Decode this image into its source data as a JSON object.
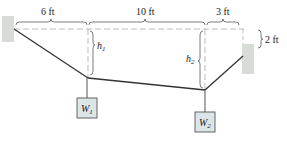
{
  "diagram": {
    "dimensions": {
      "span_left": "6 ft",
      "span_middle": "10 ft",
      "span_right": "3 ft",
      "right_support_drop": "2 ft"
    },
    "sags": {
      "h1": {
        "symbol": "h",
        "subscript": "1"
      },
      "h2": {
        "symbol": "h",
        "subscript": "2"
      }
    },
    "weights": {
      "w1": {
        "symbol": "W",
        "subscript": "1"
      },
      "w2": {
        "symbol": "W",
        "subscript": "2"
      }
    },
    "colors": {
      "cable": "#333333",
      "dashed": "#aaaaaa",
      "support": "#d8dcd6",
      "weight_fill": "#dce6e8",
      "weight_border": "#555555"
    }
  }
}
